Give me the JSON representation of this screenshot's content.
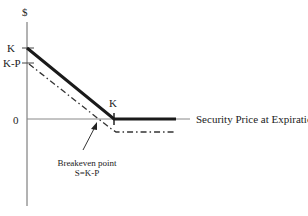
{
  "diagram": {
    "type": "option-payoff",
    "y_axis": {
      "label": "$",
      "ticks": [
        "K",
        "K-P",
        "0"
      ]
    },
    "x_axis": {
      "label": "Security Price at Expiration",
      "ticks": [
        "K"
      ]
    },
    "annotation": {
      "line1": "Breakeven point",
      "line2": "S=K-P"
    },
    "series": [
      {
        "name": "payoff",
        "style": "solid-thick",
        "color": "#1a1a1a"
      },
      {
        "name": "profit",
        "style": "dash-dot",
        "color": "#333333"
      }
    ]
  }
}
